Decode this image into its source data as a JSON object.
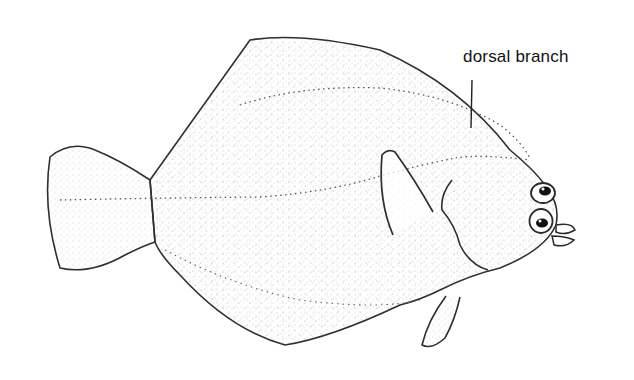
{
  "figure": {
    "labels": [
      {
        "text": "dorsal branch",
        "target": "dorsal branch of lateral line"
      }
    ]
  },
  "colors": {
    "background": "#ffffff",
    "outline": "#2a2a2a",
    "stipple": "#8a8a8a",
    "label": "#111111"
  }
}
